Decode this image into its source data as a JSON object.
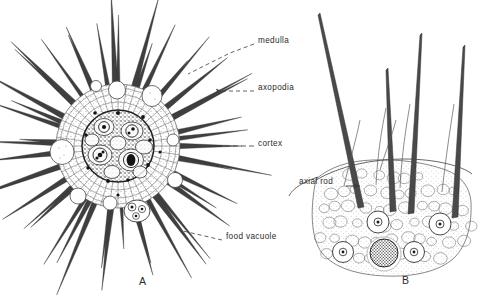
{
  "figure": {
    "caption_letters": {
      "left": "A",
      "right": "B"
    },
    "background_color": "#ffffff",
    "ink_color": "#2b2b2b"
  },
  "panel_a": {
    "name": "radiolarian-whole-cell",
    "letter": "A",
    "labels": [
      {
        "key": "medulla",
        "text": "medulla",
        "x": 258,
        "y": 41,
        "leader_to_x": 186,
        "leader_to_y": 75,
        "style": "dashed"
      },
      {
        "key": "axopodia",
        "text": "axopodia",
        "x": 258,
        "y": 88,
        "leader_to_x": 196,
        "leader_to_y": 96,
        "style": "dashed-arrow"
      },
      {
        "key": "cortex",
        "text": "cortex",
        "x": 258,
        "y": 144,
        "leader_to_x": 196,
        "leader_to_y": 146,
        "style": "dashed"
      },
      {
        "key": "food_vacuole",
        "text": "food vacuole",
        "x": 226,
        "y": 237,
        "leader_to_x": 150,
        "leader_to_y": 214,
        "style": "dashed"
      }
    ],
    "structures": {
      "medulla_radius": 36,
      "cortex_radius": 62,
      "center_x": 118,
      "center_y": 146,
      "axopodia_count": 46,
      "vacuole_count": 8,
      "food_vacuole_center": [
        137,
        211
      ]
    }
  },
  "panel_b": {
    "name": "radiolarian-cortex-detail",
    "letter": "B",
    "labels": [
      {
        "key": "axial_rod",
        "text": "axial rod",
        "x": 301,
        "y": 182,
        "leader_to_x": 358,
        "leader_to_y": 186,
        "style": "arrow"
      }
    ],
    "structures": {
      "spine_count": 4,
      "vacuole_count": 5,
      "dark_food_vacuole_center": [
        384,
        254
      ]
    }
  }
}
